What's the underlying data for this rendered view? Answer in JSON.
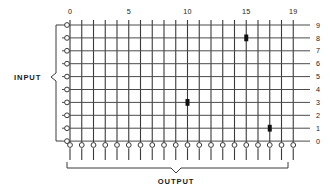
{
  "diagram": {
    "title_input": "INPUT",
    "title_output": "OUTPUT",
    "type": "crossbar-switch-matrix",
    "column_labels": [
      "0",
      "5",
      "10",
      "15",
      "19"
    ],
    "column_label_indices": [
      0,
      5,
      10,
      15,
      19
    ],
    "row_labels": [
      "9",
      "8",
      "7",
      "6",
      "5",
      "4",
      "3",
      "2",
      "1",
      "0"
    ],
    "columns_count": 20,
    "rows_count": 10,
    "colors": {
      "line": "#4a4a4a",
      "vline": "#3a3a3a",
      "marker": "#111111",
      "node_fill": "#ffffff",
      "text": "#1a1a1a",
      "background": "#ffffff"
    },
    "crosspoints": [
      {
        "col": 15,
        "row": 8
      },
      {
        "col": 10,
        "row": 3
      },
      {
        "col": 17,
        "row": 1
      }
    ]
  },
  "chart_data": {
    "type": "heatmap",
    "xlabel": "OUTPUT",
    "ylabel": "INPUT",
    "x": [
      0,
      1,
      2,
      3,
      4,
      5,
      6,
      7,
      8,
      9,
      10,
      11,
      12,
      13,
      14,
      15,
      16,
      17,
      18,
      19
    ],
    "y": [
      0,
      1,
      2,
      3,
      4,
      5,
      6,
      7,
      8,
      9
    ],
    "xticklabels": [
      "0",
      "5",
      "10",
      "15",
      "19"
    ],
    "yticklabels": [
      "9",
      "8",
      "7",
      "6",
      "5",
      "4",
      "3",
      "2",
      "1",
      "0"
    ],
    "xlim": [
      0,
      19
    ],
    "ylim": [
      0,
      9
    ],
    "grid": true,
    "legend": "none",
    "points": [
      {
        "x": 15,
        "y": 8
      },
      {
        "x": 10,
        "y": 3
      },
      {
        "x": 17,
        "y": 1
      }
    ],
    "annotations": [
      "INPUT",
      "OUTPUT"
    ]
  }
}
